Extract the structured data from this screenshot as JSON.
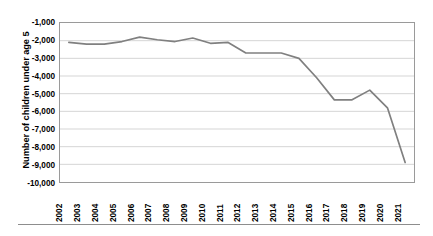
{
  "chart_data": {
    "type": "line",
    "title": "",
    "xlabel": "",
    "ylabel": "Number of children under age 5",
    "categories": [
      "2002",
      "2003",
      "2004",
      "2005",
      "2006",
      "2007",
      "2008",
      "2009",
      "2010",
      "2011",
      "2012",
      "2013",
      "2014",
      "2015",
      "2016",
      "2017",
      "2018",
      "2019",
      "2020",
      "2021"
    ],
    "values": [
      -2100,
      -2200,
      -2200,
      -2050,
      -1800,
      -1950,
      -2050,
      -1850,
      -2150,
      -2100,
      -2700,
      -2700,
      -2700,
      -3000,
      -4100,
      -5350,
      -5350,
      -4800,
      -5800,
      -8900
    ],
    "series": [
      {
        "name": "Number of children under age 5",
        "values": [
          -2100,
          -2200,
          -2200,
          -2050,
          -1800,
          -1950,
          -2050,
          -1850,
          -2150,
          -2100,
          -2700,
          -2700,
          -2700,
          -3000,
          -4100,
          -5350,
          -5350,
          -4800,
          -5800,
          -8900
        ]
      }
    ],
    "ylim": [
      -10000,
      -1000
    ],
    "ytick_labels": [
      "-1,000",
      "-2,000",
      "-3,000",
      "-4,000",
      "-5,000",
      "-6,000",
      "-7,000",
      "-8,000",
      "-9,000",
      "-10,000"
    ],
    "ytick_values": [
      -1000,
      -2000,
      -3000,
      -4000,
      -5000,
      -6000,
      -7000,
      -8000,
      -9000,
      -10000
    ],
    "grid": "horizontal",
    "legend": "none",
    "line_color": "#808080",
    "gridline_color": "#d4d4d4",
    "axis_color": "#9a9a9a"
  }
}
